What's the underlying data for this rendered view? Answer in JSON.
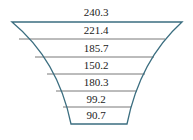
{
  "diagram": {
    "type": "funnel",
    "stroke_color": "#3b6e80",
    "divider_color": "#555555",
    "top_label": "240.3",
    "levels": [
      {
        "label": "221.4"
      },
      {
        "label": "185.7"
      },
      {
        "label": "150.2"
      },
      {
        "label": "180.3"
      },
      {
        "label": "99.2"
      },
      {
        "label": "90.7"
      }
    ]
  }
}
